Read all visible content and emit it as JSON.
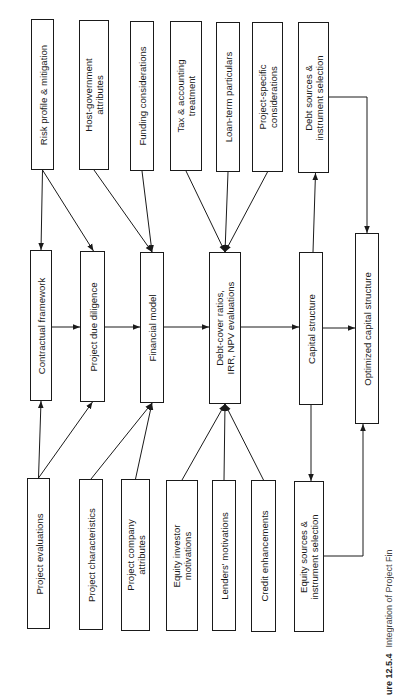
{
  "diagram": {
    "type": "flowchart",
    "orientation": "rotated-90-ccw",
    "top_row": [
      {
        "id": "risk",
        "label": "Risk profile & mitigation"
      },
      {
        "id": "hostgov",
        "label": "Host-government\nattributes"
      },
      {
        "id": "funding",
        "label": "Funding considerations"
      },
      {
        "id": "tax",
        "label": "Tax & accounting\ntreatment"
      },
      {
        "id": "loanterm",
        "label": "Loan-term particulars"
      },
      {
        "id": "projspec",
        "label": "Project-specific\nconsiderations"
      },
      {
        "id": "debtsrc",
        "label": "Debt sources &\ninstrument selection"
      }
    ],
    "middle_row": [
      {
        "id": "contract",
        "label": "Contractual framework"
      },
      {
        "id": "duediligence",
        "label": "Project due diligence"
      },
      {
        "id": "finmodel",
        "label": "Financial model"
      },
      {
        "id": "debtcover",
        "label": "Debt-cover ratios,\nIRR, NPV evaluations"
      },
      {
        "id": "capstruct",
        "label": "Capital structure"
      },
      {
        "id": "optcap",
        "label": "Optimized capital structure"
      }
    ],
    "bottom_row": [
      {
        "id": "projeval",
        "label": "Project evaluations"
      },
      {
        "id": "projchar",
        "label": "Project characteristics"
      },
      {
        "id": "projco",
        "label": "Project company\nattributes"
      },
      {
        "id": "equityinv",
        "label": "Equity investor\nmotivations"
      },
      {
        "id": "lenders",
        "label": "Lenders' motivations"
      },
      {
        "id": "credit",
        "label": "Credit enhancements"
      },
      {
        "id": "equitysrc",
        "label": "Equity sources &\ninstrument selection"
      }
    ],
    "edges": [
      {
        "from": "risk",
        "to": "contract"
      },
      {
        "from": "risk",
        "to": "duediligence"
      },
      {
        "from": "hostgov",
        "to": "finmodel"
      },
      {
        "from": "funding",
        "to": "finmodel"
      },
      {
        "from": "tax",
        "to": "debtcover"
      },
      {
        "from": "loanterm",
        "to": "debtcover"
      },
      {
        "from": "projspec",
        "to": "debtcover"
      },
      {
        "from": "capstruct",
        "to": "debtsrc"
      },
      {
        "from": "debtsrc",
        "to": "optcap"
      },
      {
        "from": "projeval",
        "to": "contract"
      },
      {
        "from": "projeval",
        "to": "duediligence"
      },
      {
        "from": "projchar",
        "to": "finmodel"
      },
      {
        "from": "projco",
        "to": "finmodel"
      },
      {
        "from": "equityinv",
        "to": "debtcover"
      },
      {
        "from": "lenders",
        "to": "debtcover"
      },
      {
        "from": "credit",
        "to": "debtcover"
      },
      {
        "from": "capstruct",
        "to": "equitysrc"
      },
      {
        "from": "equitysrc",
        "to": "optcap"
      },
      {
        "from": "contract",
        "to": "duediligence"
      },
      {
        "from": "duediligence",
        "to": "finmodel"
      },
      {
        "from": "finmodel",
        "to": "debtcover"
      },
      {
        "from": "debtcover",
        "to": "capstruct"
      },
      {
        "from": "capstruct",
        "to": "optcap"
      }
    ]
  },
  "caption": {
    "number": "ure 12.5.4",
    "text": "Integration of Project Fin"
  }
}
